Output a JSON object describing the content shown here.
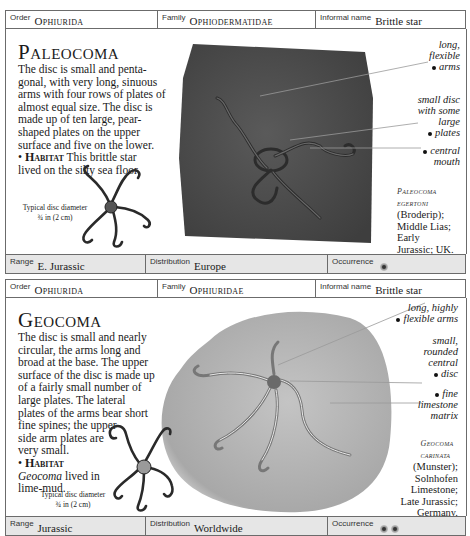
{
  "entries": [
    {
      "header": {
        "order_label": "Order",
        "order_value": "Ophiurida",
        "family_label": "Family",
        "family_value": "Ophiodermatidae",
        "informal_label": "Informal name",
        "informal_value": "Brittle star"
      },
      "title": "Paleocoma",
      "description": "The disc is small and pentagonal, with very long, sinuous arms with four rows of plates of almost equal size. The disc is made up of ten large, pear-shaped plates on the upper surface and five on the lower.",
      "description_lines": [
        "The disc is small and penta-",
        "gonal, with very long, sinuous",
        "arms with four rows of plates of",
        "almost equal size. The disc is",
        "made up of ten large, pear-",
        "shaped plates on the upper",
        "surface and five on the lower."
      ],
      "habitat_label": "Habitat",
      "habitat_text": "This brittle star",
      "habitat_text_2": "lived on the silty sea floor.",
      "caption_line1": "Typical disc diameter",
      "caption_line2": "¾ in (2 cm)",
      "annotations": [
        {
          "text_lines": [
            "long,",
            "flexible",
            "arms"
          ]
        },
        {
          "text_lines": [
            "small disc",
            "with some",
            "large",
            "plates"
          ]
        },
        {
          "text_lines": [
            "central",
            "mouth"
          ]
        }
      ],
      "species": {
        "name_line1": "Paleocoma",
        "name_line2": "egertoni",
        "lines": [
          "(Broderip);",
          "Middle Lias;",
          "Early",
          "Jurassic; UK."
        ]
      },
      "footer": {
        "range_label": "Range",
        "range_value": "E. Jurassic",
        "distribution_label": "Distribution",
        "distribution_value": "Europe",
        "occurrence_label": "Occurrence",
        "occurrence_count": 1
      }
    },
    {
      "header": {
        "order_label": "Order",
        "order_value": "Ophiurida",
        "family_label": "Family",
        "family_value": "Ophiuridae",
        "informal_label": "Informal name",
        "informal_value": "Brittle star"
      },
      "title": "Geocoma",
      "description_lines": [
        "The disc is small and nearly",
        "circular, the arms long and",
        "broad at the base. The upper",
        "surface of the disc is made up",
        "of a fairly small number of",
        "large plates. The lateral",
        "plates of the arms bear short",
        "fine spines; the upper",
        "side arm plates are",
        "very small."
      ],
      "habitat_label": "Habitat",
      "habitat_genus": "Geocoma",
      "habitat_text": "lived in",
      "habitat_text_2": "lime-mud.",
      "caption_line1": "Typical disc diameter",
      "caption_line2": "¾ in (2 cm)",
      "annotations": [
        {
          "text_lines": [
            "long, highly",
            "flexible arms"
          ]
        },
        {
          "text_lines": [
            "small,",
            "rounded",
            "central",
            "disc"
          ]
        },
        {
          "text_lines": [
            "fine",
            "limestone",
            "matrix"
          ]
        }
      ],
      "species": {
        "name_line1": "Geocoma",
        "name_line2": "carinata",
        "lines": [
          "(Munster);",
          "Solnhofen",
          "Limestone;",
          "Late Jurassic;",
          "Germany."
        ]
      },
      "footer": {
        "range_label": "Range",
        "range_value": "Jurassic",
        "distribution_label": "Distribution",
        "distribution_value": "Worldwide",
        "occurrence_label": "Occurrence",
        "occurrence_count": 2
      }
    }
  ],
  "colors": {
    "border": "#6b6b6b",
    "footer_bg": "#e6e6e6",
    "slab_dark": "#4a4a4a",
    "slab_light": "#b8b8b8"
  }
}
